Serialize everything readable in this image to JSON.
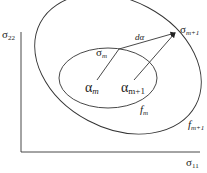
{
  "diagram": {
    "axes": {
      "y_label": "σ",
      "y_sub": "22",
      "x_label": "σ",
      "x_sub": "11"
    },
    "ellipses": {
      "inner_label": "f",
      "inner_sub": "m",
      "outer_label": "f",
      "outer_sub": "m+1"
    },
    "points": {
      "sigma_m": "σ",
      "sigma_m_sub": "m",
      "sigma_m1": "σ",
      "sigma_m1_sub": "m+1",
      "alpha_m": "α",
      "alpha_m_sub": "m",
      "alpha_m1": "α",
      "alpha_m1_sub": "m+1"
    },
    "increment_label": "dα",
    "colors": {
      "stroke": "#333333",
      "text": "#222222",
      "background": "#ffffff"
    }
  }
}
